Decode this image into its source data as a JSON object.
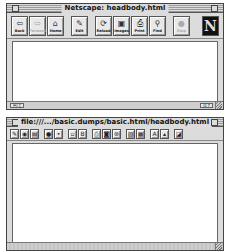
{
  "browser_window": {
    "title": "Netscape: headbody.html",
    "toolbar": [
      {
        "label": "Back",
        "icon": "back-arrow-icon",
        "glyph": "⇦",
        "enabled": true
      },
      {
        "label": "Forward",
        "icon": "forward-arrow-icon",
        "glyph": "⇨",
        "enabled": false
      },
      {
        "label": "Home",
        "icon": "home-icon",
        "glyph": "⌂",
        "enabled": true
      },
      {
        "label": "Edit",
        "icon": "pencil-icon",
        "glyph": "✎",
        "enabled": true
      },
      {
        "label": "Reload",
        "icon": "reload-icon",
        "glyph": "⟳",
        "enabled": true
      },
      {
        "label": "Images",
        "icon": "images-icon",
        "glyph": "▣",
        "enabled": true
      },
      {
        "label": "Print",
        "icon": "printer-icon",
        "glyph": "⎙",
        "enabled": true
      },
      {
        "label": "Find",
        "icon": "binoculars-icon",
        "glyph": "⚲",
        "enabled": true
      },
      {
        "label": "Stop",
        "icon": "stop-icon",
        "glyph": "●",
        "enabled": false
      }
    ],
    "logo": "N",
    "status_left": "✉/♫",
    "status_right": "⊡ ?"
  },
  "editor_window": {
    "title": "file:///.../basic.dumps/basic.html/headbody.html",
    "toolbar": [
      {
        "name": "new-document-icon",
        "glyph": "✎"
      },
      {
        "name": "open-icon",
        "glyph": "◉"
      },
      {
        "name": "save-icon",
        "glyph": "▤"
      },
      {
        "sep": true
      },
      {
        "name": "bullet-dark-icon",
        "glyph": "●"
      },
      {
        "name": "bullet-light-icon",
        "glyph": "•"
      },
      {
        "sep": true
      },
      {
        "name": "copy-icon",
        "glyph": "▫"
      },
      {
        "name": "paste-icon",
        "glyph": "B"
      },
      {
        "sep": true
      },
      {
        "name": "print-icon",
        "glyph": "⎙"
      },
      {
        "name": "publish-icon",
        "glyph": "◙"
      },
      {
        "name": "browse-icon",
        "glyph": "⊛"
      },
      {
        "sep": true
      },
      {
        "name": "insert-image-icon",
        "glyph": "▨"
      },
      {
        "name": "insert-table-icon",
        "glyph": "▦"
      },
      {
        "sep": true
      },
      {
        "name": "font-size-up-icon",
        "glyph": "A"
      },
      {
        "name": "font-size-down-icon",
        "glyph": "▴"
      },
      {
        "sep": true
      },
      {
        "name": "properties-icon",
        "glyph": "◪"
      }
    ]
  }
}
